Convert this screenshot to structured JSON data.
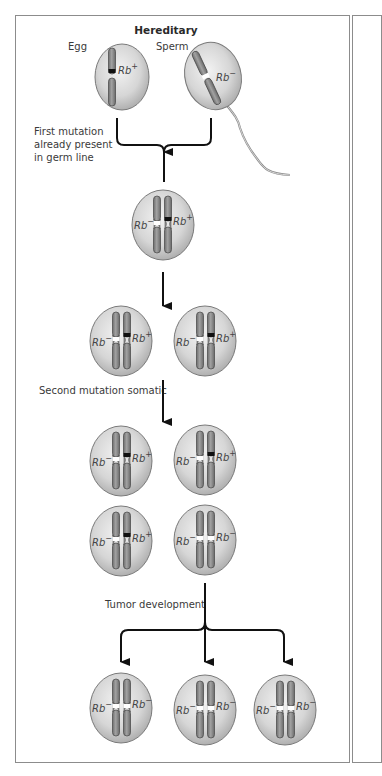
{
  "diagram": {
    "title": "Hereditary",
    "labels": {
      "egg": "Egg",
      "sperm": "Sperm",
      "first_mutation_line1": "First mutation",
      "first_mutation_line2": "already present",
      "first_mutation_line3": "in germ line",
      "second_mutation": "Second mutation somatic",
      "tumor_development": "Tumor development"
    },
    "gene": "Rb",
    "alleles": {
      "plus": "+",
      "minus": "−"
    },
    "colors": {
      "cell_fill_center": "#eeeeee",
      "cell_fill_edge": "#b4b4b4",
      "cell_outline": "#7a7a7a",
      "chromosome_fill": "#8d8d8d",
      "chromosome_outline": "#4f4f4f",
      "wild_type_band": "#111111",
      "mutant_band": "#ffffff",
      "arrow": "#111111",
      "frame": "#8c8c8c"
    },
    "stages": [
      {
        "name": "gametes",
        "cells": [
          {
            "id": "egg",
            "alleles": [
              "+"
            ]
          },
          {
            "id": "sperm",
            "alleles": [
              "-"
            ]
          }
        ]
      },
      {
        "name": "zygote",
        "cells": [
          {
            "alleles": [
              "-",
              "+"
            ]
          }
        ]
      },
      {
        "name": "divided",
        "cells": [
          {
            "alleles": [
              "-",
              "+"
            ]
          },
          {
            "alleles": [
              "-",
              "+"
            ]
          }
        ]
      },
      {
        "name": "after-second-mutation",
        "cells": [
          {
            "alleles": [
              "-",
              "+"
            ]
          },
          {
            "alleles": [
              "-",
              "+"
            ]
          },
          {
            "alleles": [
              "-",
              "+"
            ]
          },
          {
            "alleles": [
              "-",
              "-"
            ]
          }
        ]
      },
      {
        "name": "tumor",
        "cells": [
          {
            "alleles": [
              "-",
              "-"
            ]
          },
          {
            "alleles": [
              "-",
              "-"
            ]
          },
          {
            "alleles": [
              "-",
              "-"
            ]
          }
        ]
      }
    ]
  }
}
